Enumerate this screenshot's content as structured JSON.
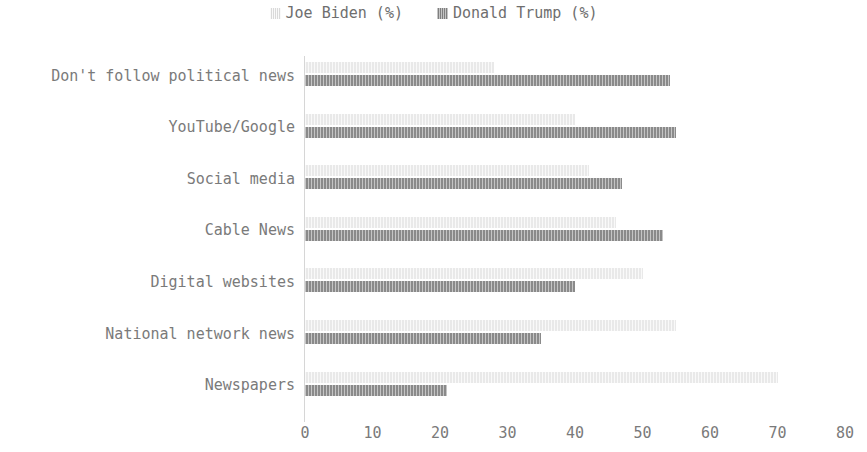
{
  "chart_data": {
    "type": "bar",
    "orientation": "horizontal",
    "title": "",
    "subtitle": "",
    "xlabel": "",
    "ylabel": "",
    "xlim": [
      0,
      80
    ],
    "xticks": [
      "0",
      "10",
      "20",
      "30",
      "40",
      "50",
      "60",
      "70",
      "80"
    ],
    "grid": false,
    "legend_position": "top-center",
    "categories": [
      "Don't follow political news",
      "YouTube/Google",
      "Social media",
      "Cable News",
      "Digital websites",
      "National network news",
      "Newspapers"
    ],
    "series": [
      {
        "name": "Joe Biden (%)",
        "color": "#e9e9e9",
        "values": [
          28,
          40,
          42,
          46,
          50,
          55,
          70
        ]
      },
      {
        "name": "Donald Trump (%)",
        "color": "#8a8a8a",
        "values": [
          54,
          55,
          47,
          53,
          40,
          35,
          21
        ]
      }
    ]
  },
  "legend": {
    "items": [
      {
        "label": "Joe Biden (%)",
        "swatch": "biden"
      },
      {
        "label": "Donald Trump (%)",
        "swatch": "trump"
      }
    ]
  }
}
